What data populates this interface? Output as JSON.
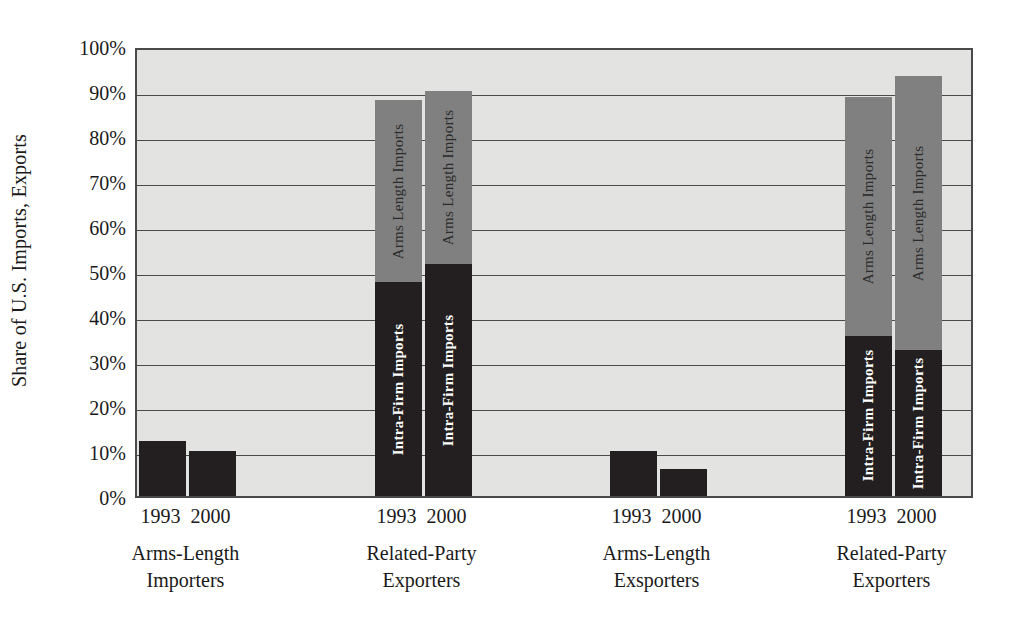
{
  "chart_data": {
    "type": "bar",
    "stacked": true,
    "title": "",
    "subtitle": "",
    "xlabel": "",
    "ylabel": "Share of U.S. Imports, Exports",
    "ylim": [
      0,
      100
    ],
    "yticks": [
      "0%",
      "10%",
      "20%",
      "30%",
      "40%",
      "50%",
      "60%",
      "70%",
      "80%",
      "90%",
      "100%"
    ],
    "ytick_values": [
      0,
      10,
      20,
      30,
      40,
      50,
      60,
      70,
      80,
      90,
      100
    ],
    "grid": true,
    "legend_position": "in-bar-labels",
    "series": [
      {
        "name": "Intra-Firm Imports",
        "key": "intra_firm"
      },
      {
        "name": "Arms Length Imports",
        "key": "arms_length"
      }
    ],
    "groups": [
      {
        "caption_line1": "Arms-Length",
        "caption_line2": "Importers",
        "bars": [
          {
            "year": "1993",
            "total": 12.2,
            "segments": [
              {
                "series": "Intra-Firm Imports",
                "value": 12.2,
                "color": "#231f20",
                "label": ""
              }
            ]
          },
          {
            "year": "2000",
            "total": 10.0,
            "segments": [
              {
                "series": "Intra-Firm Imports",
                "value": 10.0,
                "color": "#231f20",
                "label": ""
              }
            ]
          }
        ]
      },
      {
        "caption_line1": "Related-Party",
        "caption_line2": "Exporters",
        "bars": [
          {
            "year": "1993",
            "total": 88.0,
            "segments": [
              {
                "series": "Intra-Firm Imports",
                "value": 47.5,
                "color": "#231f20",
                "label": "Intra-Firm Imports"
              },
              {
                "series": "Arms Length Imports",
                "value": 40.5,
                "color": "#808080",
                "label": "Arms Length  Imports"
              }
            ]
          },
          {
            "year": "2000",
            "total": 90.0,
            "segments": [
              {
                "series": "Intra-Firm Imports",
                "value": 51.5,
                "color": "#231f20",
                "label": "Intra-Firm Imports"
              },
              {
                "series": "Arms Length Imports",
                "value": 38.5,
                "color": "#808080",
                "label": "Arms Length  Imports"
              }
            ]
          }
        ]
      },
      {
        "caption_line1": "Arms-Length",
        "caption_line2": "Exsporters",
        "bars": [
          {
            "year": "1993",
            "total": 10.0,
            "segments": [
              {
                "series": "Intra-Firm Imports",
                "value": 10.0,
                "color": "#231f20",
                "label": ""
              }
            ]
          },
          {
            "year": "2000",
            "total": 6.0,
            "segments": [
              {
                "series": "Intra-Firm Imports",
                "value": 6.0,
                "color": "#231f20",
                "label": ""
              }
            ]
          }
        ]
      },
      {
        "caption_line1": "Related-Party",
        "caption_line2": "Exporters",
        "bars": [
          {
            "year": "1993",
            "total": 88.7,
            "segments": [
              {
                "series": "Intra-Firm Imports",
                "value": 35.6,
                "color": "#231f20",
                "label": "Intra-Firm Imports"
              },
              {
                "series": "Arms Length Imports",
                "value": 53.1,
                "color": "#808080",
                "label": "Arms Length Imports"
              }
            ]
          },
          {
            "year": "2000",
            "total": 93.3,
            "segments": [
              {
                "series": "Intra-Firm Imports",
                "value": 32.4,
                "color": "#231f20",
                "label": "Intra-Firm Imports"
              },
              {
                "series": "Arms Length Imports",
                "value": 60.9,
                "color": "#808080",
                "label": "Arms Length Imports"
              }
            ]
          }
        ]
      }
    ],
    "colors": {
      "intra_firm": "#231f20",
      "arms_length": "#808080",
      "plot_background": "#e3e3e1",
      "axis": "#4a4a4a",
      "text": "#1a1a1a"
    }
  }
}
